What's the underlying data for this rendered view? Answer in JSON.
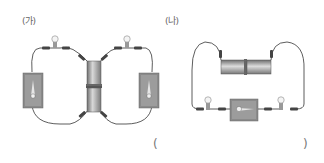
{
  "diagram": {
    "type": "electric-circuits",
    "panels": [
      {
        "label": "(가)",
        "components": {
          "bulbs": 2,
          "switches": 2,
          "batteries": 2,
          "battery_orientation": "vertical-center"
        }
      },
      {
        "label": "(나)",
        "components": {
          "bulbs": 2,
          "switches": 1,
          "batteries": 2,
          "battery_orientation": "horizontal-top"
        }
      }
    ],
    "answer": {
      "open": "(",
      "close": ")"
    },
    "colors": {
      "wire": "#333333",
      "switch_board": "#8a8a8a",
      "battery": "#9a9a9a",
      "bulb": "#cccccc"
    }
  }
}
